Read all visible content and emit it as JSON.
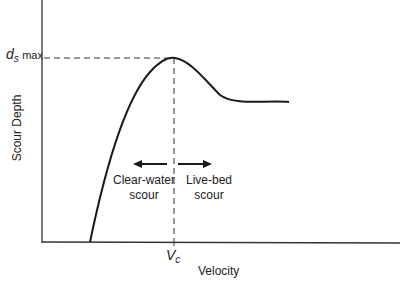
{
  "diagram": {
    "y_axis_label": "Scour Depth",
    "x_axis_label": "Velocity",
    "y_marker": {
      "symbol": "d",
      "subscript": "s",
      "suffix": "max"
    },
    "x_marker": {
      "symbol": "V",
      "subscript": "c"
    },
    "regions": [
      {
        "line1": "Clear-water",
        "line2": "scour",
        "arrow": "left"
      },
      {
        "line1": "Live-bed",
        "line2": "scour",
        "arrow": "right"
      }
    ],
    "colors": {
      "line": "#1a1a1a",
      "axis": "#333333",
      "background": "#ffffff"
    }
  }
}
